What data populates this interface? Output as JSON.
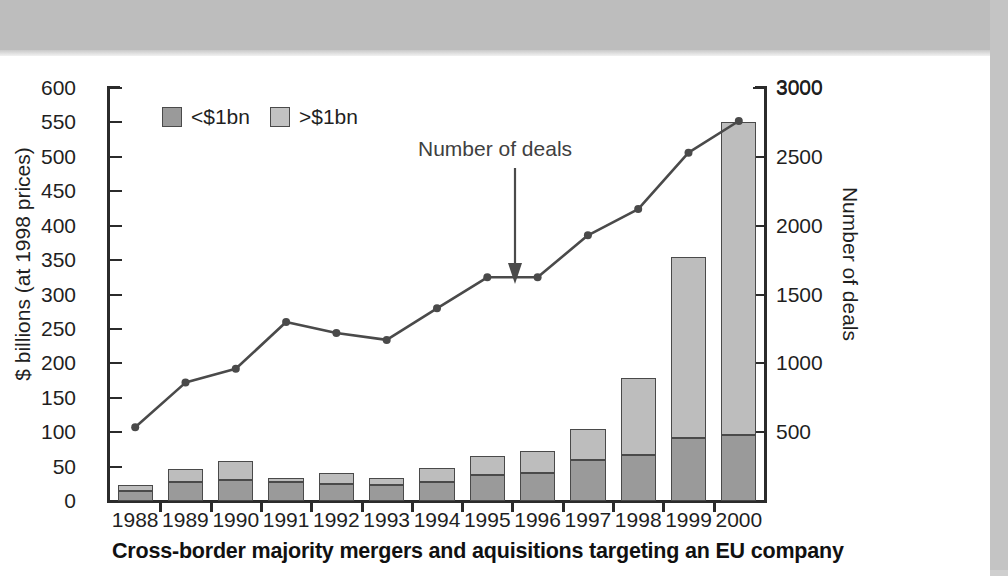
{
  "chart_data": {
    "type": "bar",
    "title": "Cross-border majority mergers and aquisitions targeting an EU company",
    "categories": [
      "1988",
      "1989",
      "1990",
      "1991",
      "1992",
      "1993",
      "1994",
      "1995",
      "1996",
      "1997",
      "1998",
      "1999",
      "2000"
    ],
    "xlabel": "",
    "ylabel": "$ billions (at 1998 prices)",
    "ylabel_secondary": "Number of deals",
    "ylim": [
      0,
      600
    ],
    "ylim_secondary": [
      0,
      3000
    ],
    "yticks": [
      0,
      50,
      100,
      150,
      200,
      250,
      300,
      350,
      400,
      450,
      500,
      550,
      600
    ],
    "yticks_secondary": [
      500,
      1000,
      1500,
      2000,
      2500,
      3000
    ],
    "grid": false,
    "legend_position": "top-left",
    "series": [
      {
        "name": "<$1bn",
        "type": "bar",
        "stack": "total",
        "axis": "left",
        "color": "#9a9a9a",
        "values": [
          14,
          27,
          31,
          28,
          25,
          23,
          27,
          38,
          40,
          59,
          67,
          91,
          96
        ]
      },
      {
        "name": ">$1bn",
        "type": "bar",
        "stack": "total",
        "axis": "left",
        "color": "#bdbdbd",
        "values": [
          9,
          19,
          27,
          5,
          15,
          10,
          21,
          27,
          32,
          45,
          111,
          263,
          455
        ]
      },
      {
        "name": "Number of deals",
        "type": "line",
        "axis": "right",
        "color": "#4a4a4a",
        "values": [
          535,
          860,
          960,
          1300,
          1220,
          1170,
          1400,
          1625,
          1625,
          1930,
          2120,
          2530,
          2760
        ]
      }
    ],
    "totals": [
      23,
      46,
      58,
      33,
      40,
      33,
      48,
      65,
      72,
      104,
      178,
      354,
      551
    ],
    "annotations": [
      {
        "text": "Number of deals",
        "points_to": "1996",
        "style": "down-arrow"
      }
    ]
  },
  "legend": {
    "items": [
      {
        "label": "<$1bn",
        "color": "#9a9a9a"
      },
      {
        "label": ">$1bn",
        "color": "#c2c2c2"
      }
    ]
  },
  "axis_left_label": "$ billions (at 1998 prices)",
  "axis_right_label": "Number of deals",
  "caption": "Cross-border majority mergers and aquisitions targeting an EU company",
  "annotation_text": "Number of deals"
}
